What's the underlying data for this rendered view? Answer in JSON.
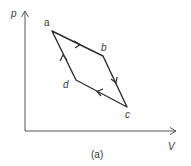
{
  "diagram": {
    "type": "pV-cycle",
    "axes": {
      "y_label": "p",
      "x_label": "V"
    },
    "vertices": [
      {
        "name": "a",
        "x": 52,
        "y": 31
      },
      {
        "name": "b",
        "x": 103,
        "y": 56
      },
      {
        "name": "c",
        "x": 127,
        "y": 107
      },
      {
        "name": "d",
        "x": 76,
        "y": 80
      }
    ],
    "edges": [
      {
        "from": "a",
        "to": "b"
      },
      {
        "from": "b",
        "to": "c"
      },
      {
        "from": "c",
        "to": "d"
      },
      {
        "from": "d",
        "to": "a"
      }
    ],
    "caption": "(a)",
    "colors": {
      "line": "#2e2e2e",
      "axis": "#555555",
      "text": "#3a3a3a"
    }
  }
}
